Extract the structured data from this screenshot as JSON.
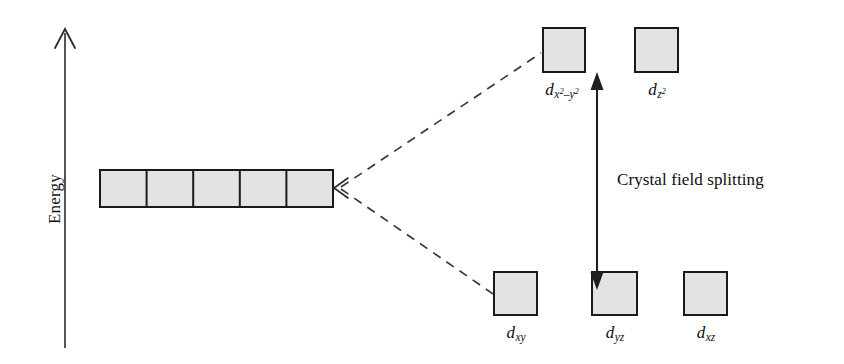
{
  "diagram": {
    "axis": {
      "label": "Energy",
      "direction": "up"
    },
    "splitting": {
      "label": "Crystal field splitting",
      "arrow": "double-headed-vertical"
    },
    "degenerate_set": {
      "count": 5,
      "description": "five degenerate d orbitals"
    },
    "upper_orbitals": [
      {
        "symbol": "d",
        "sub": "x",
        "sup1": "2",
        "dash": "–",
        "sub2": "y",
        "sup2": "2",
        "name": "d-x2-y2"
      },
      {
        "symbol": "d",
        "sub": "z",
        "sup1": "2",
        "name": "d-z2"
      }
    ],
    "lower_orbitals": [
      {
        "symbol": "d",
        "sub": "xy",
        "name": "d-xy"
      },
      {
        "symbol": "d",
        "sub": "yz",
        "name": "d-yz"
      },
      {
        "symbol": "d",
        "sub": "xz",
        "name": "d-xz"
      }
    ],
    "colors": {
      "box_fill": "#e3e3e3",
      "box_stroke": "#1a1a1a",
      "line": "#333333",
      "text": "#0d0d0d",
      "background": "#ffffff"
    }
  }
}
